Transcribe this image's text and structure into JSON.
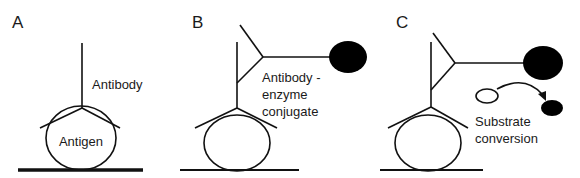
{
  "figure": {
    "panels": [
      {
        "id": "A",
        "label": "A",
        "texts": {
          "antibody": "Antibody",
          "antigen": "Antigen"
        }
      },
      {
        "id": "B",
        "label": "B",
        "texts": {
          "line1": "Antibody -",
          "line2": "enzyme",
          "line3": "conjugate"
        }
      },
      {
        "id": "C",
        "label": "C",
        "texts": {
          "line1": "Substrate",
          "line2": "conversion"
        }
      }
    ],
    "colors": {
      "stroke": "#111111",
      "enzyme": "#000000",
      "background": "#ffffff"
    }
  }
}
